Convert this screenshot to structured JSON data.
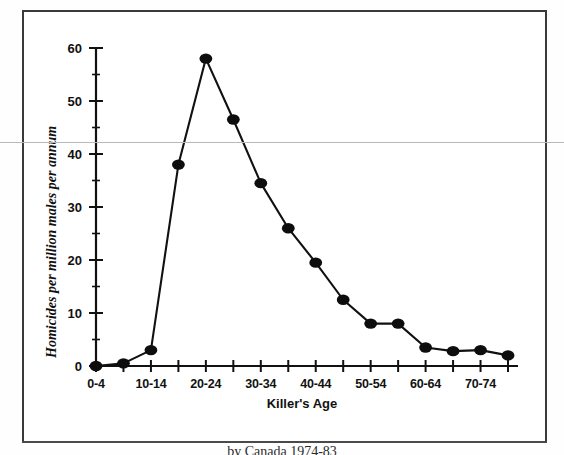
{
  "figure": {
    "caption": "by Canada 1974-83"
  },
  "chart_data": {
    "type": "line",
    "title": "",
    "xlabel": "Killer's Age",
    "ylabel": "Homicides per million males per annum",
    "categories": [
      "0-4",
      "5-9",
      "10-14",
      "15-19",
      "20-24",
      "25-29",
      "30-34",
      "35-39",
      "40-44",
      "45-49",
      "50-54",
      "55-59",
      "60-64",
      "65-69",
      "70-74",
      "75+"
    ],
    "tick_labels_x": [
      "0-4",
      "",
      "10-14",
      "",
      "20-24",
      "",
      "30-34",
      "",
      "40-44",
      "",
      "50-54",
      "",
      "60-64",
      "",
      "70-74",
      ""
    ],
    "values": [
      0,
      0.5,
      3,
      38,
      58,
      46.5,
      34.5,
      26,
      19.5,
      12.5,
      8,
      8,
      3.5,
      2.8,
      3,
      2
    ],
    "ylim": [
      0,
      60
    ],
    "yticks": [
      0,
      10,
      20,
      30,
      40,
      50,
      60
    ],
    "ytick_labels": [
      "0",
      "10",
      "20",
      "30",
      "40",
      "50",
      "60"
    ],
    "yminor_step": 5,
    "grid": false,
    "legend": "none",
    "marker": "filled-circle",
    "line_color": "#111111",
    "marker_color": "#0d0d0d"
  }
}
